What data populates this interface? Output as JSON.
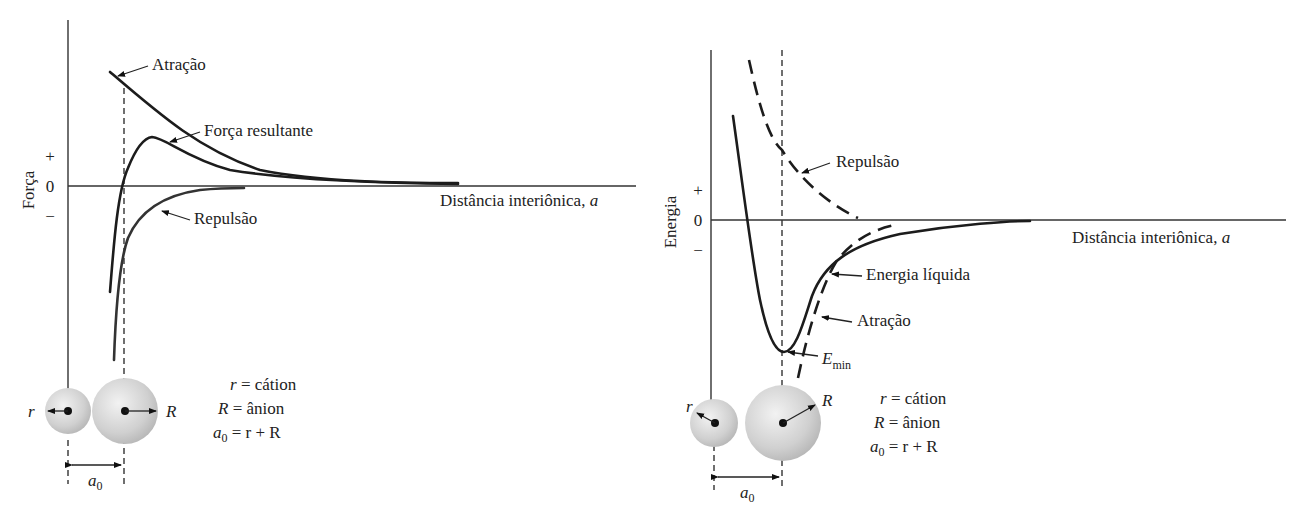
{
  "left_panel": {
    "ylabel": "Força",
    "ytick_plus": "+",
    "ytick_zero": "0",
    "ytick_minus": "−",
    "xlabel": "Distância interiônica, ",
    "xlabel_var": "a",
    "labels": {
      "attraction": "Atração",
      "net_force": "Força resultante",
      "repulsion": "Repulsão"
    },
    "ions": {
      "small_radius": "r",
      "large_radius": "R",
      "spacing": "a",
      "spacing_sub": "0"
    },
    "legend": {
      "line1_var": "r",
      "line1_text": " = cátion",
      "line2_var": "R",
      "line2_text": " = ânion",
      "line3_var": "a",
      "line3_sub": "0",
      "line3_text": " = r + R"
    }
  },
  "right_panel": {
    "ylabel": "Energia",
    "ytick_plus": "+",
    "ytick_zero": "0",
    "ytick_minus": "−",
    "xlabel": "Distância interiônica, ",
    "xlabel_var": "a",
    "labels": {
      "repulsion": "Repulsão",
      "net_energy": "Energia líquida",
      "attraction": "Atração",
      "emin_var": "E",
      "emin_sub": "min"
    },
    "ions": {
      "small_radius": "r",
      "large_radius": "R",
      "spacing": "a",
      "spacing_sub": "0"
    },
    "legend": {
      "line1_var": "r",
      "line1_text": " = cátion",
      "line2_var": "R",
      "line2_text": " = ânion",
      "line3_var": "a",
      "line3_sub": "0",
      "line3_text": " = r + R"
    }
  },
  "colors": {
    "curve": "#1c1c1c",
    "axis": "#333333",
    "ion_fill": "#d4d4d4",
    "background": "#ffffff"
  }
}
